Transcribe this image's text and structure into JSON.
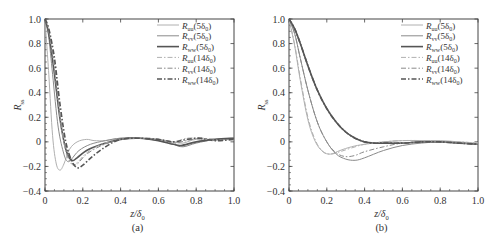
{
  "chart_data": [
    {
      "panel": "(a)",
      "type": "line",
      "title": "",
      "xlabel": "z/δ0",
      "ylabel": "R_ss",
      "xlim": [
        0,
        1.0
      ],
      "ylim": [
        -0.4,
        1.0
      ],
      "xticks": [
        "0",
        "0.2",
        "0.4",
        "0.6",
        "0.8",
        "1.0"
      ],
      "yticks": [
        "-0.4",
        "-0.2",
        "0",
        "0.2",
        "0.4",
        "0.6",
        "0.8",
        "1.0"
      ],
      "grid": false,
      "legend_position": "upper right",
      "series": [
        {
          "name": "Ruu(5δ0)",
          "style": "solid",
          "color": "#b0b0b0",
          "width": 1.0,
          "x": [
            0,
            0.02,
            0.04,
            0.06,
            0.08,
            0.1,
            0.13,
            0.17,
            0.22,
            0.26,
            0.32,
            0.4,
            0.5,
            0.6,
            0.68,
            0.73,
            0.8,
            0.9,
            1.0
          ],
          "y": [
            1.0,
            0.55,
            0.05,
            -0.18,
            -0.23,
            -0.18,
            -0.06,
            0.0,
            0.02,
            0.01,
            0.01,
            0.03,
            0.03,
            0.02,
            0.0,
            -0.01,
            0.02,
            0.01,
            0.03
          ]
        },
        {
          "name": "Rvv(5δ0)",
          "style": "solid",
          "color": "#8a8a8a",
          "width": 1.0,
          "x": [
            0,
            0.02,
            0.04,
            0.07,
            0.1,
            0.12,
            0.14,
            0.18,
            0.24,
            0.32,
            0.4,
            0.5,
            0.6,
            0.68,
            0.73,
            0.8,
            0.9,
            1.0
          ],
          "y": [
            1.0,
            0.85,
            0.55,
            0.12,
            -0.1,
            -0.16,
            -0.14,
            -0.07,
            -0.02,
            0.01,
            0.03,
            0.03,
            0.01,
            -0.02,
            -0.04,
            -0.01,
            0.02,
            0.03
          ]
        },
        {
          "name": "Rww(5δ0)",
          "style": "solid",
          "color": "#555555",
          "width": 1.6,
          "x": [
            0,
            0.02,
            0.05,
            0.08,
            0.11,
            0.14,
            0.17,
            0.22,
            0.3,
            0.4,
            0.5,
            0.6,
            0.68,
            0.72,
            0.8,
            0.9,
            1.0
          ],
          "y": [
            1.0,
            0.88,
            0.55,
            0.18,
            -0.06,
            -0.15,
            -0.13,
            -0.07,
            -0.02,
            0.02,
            0.03,
            0.01,
            -0.02,
            -0.03,
            0.0,
            0.02,
            0.03
          ]
        },
        {
          "name": "Ruu(14δ0)",
          "style": "dashdot",
          "color": "#b0b0b0",
          "width": 1.0,
          "x": [
            0,
            0.02,
            0.05,
            0.08,
            0.11,
            0.14,
            0.17,
            0.22,
            0.3,
            0.4,
            0.5,
            0.6,
            0.68,
            0.75,
            0.82,
            0.9,
            1.0
          ],
          "y": [
            1.0,
            0.9,
            0.6,
            0.2,
            -0.08,
            -0.18,
            -0.17,
            -0.09,
            -0.02,
            0.02,
            0.03,
            0.02,
            0.0,
            0.03,
            0.03,
            0.01,
            0.02
          ]
        },
        {
          "name": "Rvv(14δ0)",
          "style": "dashdot",
          "color": "#8a8a8a",
          "width": 1.0,
          "x": [
            0,
            0.02,
            0.05,
            0.08,
            0.11,
            0.14,
            0.17,
            0.22,
            0.3,
            0.4,
            0.5,
            0.6,
            0.68,
            0.75,
            0.82,
            0.9,
            1.0
          ],
          "y": [
            1.0,
            0.9,
            0.62,
            0.22,
            -0.06,
            -0.17,
            -0.18,
            -0.1,
            -0.03,
            0.02,
            0.03,
            0.02,
            -0.01,
            0.01,
            0.03,
            0.02,
            0.02
          ]
        },
        {
          "name": "Rww(14δ0)",
          "style": "dashdot",
          "color": "#555555",
          "width": 1.6,
          "x": [
            0,
            0.02,
            0.05,
            0.08,
            0.11,
            0.14,
            0.17,
            0.2,
            0.25,
            0.32,
            0.4,
            0.5,
            0.6,
            0.68,
            0.75,
            0.82,
            0.9,
            1.0
          ],
          "y": [
            1.0,
            0.92,
            0.68,
            0.3,
            0.0,
            -0.15,
            -0.21,
            -0.19,
            -0.12,
            -0.04,
            0.02,
            0.03,
            0.02,
            0.0,
            0.02,
            0.03,
            0.01,
            0.02
          ]
        }
      ]
    },
    {
      "panel": "(b)",
      "type": "line",
      "title": "",
      "xlabel": "z/δ0",
      "ylabel": "R_ss",
      "xlim": [
        0,
        1.0
      ],
      "ylim": [
        -0.4,
        1.0
      ],
      "xticks": [
        "0",
        "0.2",
        "0.4",
        "0.6",
        "0.8",
        "1.0"
      ],
      "yticks": [
        "-0.4",
        "-0.2",
        "0",
        "0.2",
        "0.4",
        "0.6",
        "0.8",
        "1.0"
      ],
      "grid": false,
      "legend_position": "upper right",
      "series": [
        {
          "name": "Ruu(5δ0)",
          "style": "solid",
          "color": "#b0b0b0",
          "width": 1.0,
          "x": [
            0,
            0.03,
            0.06,
            0.1,
            0.14,
            0.18,
            0.22,
            0.27,
            0.33,
            0.4,
            0.5,
            0.6,
            0.7,
            0.8,
            0.9,
            1.0
          ],
          "y": [
            1.0,
            0.78,
            0.5,
            0.18,
            0.0,
            -0.08,
            -0.1,
            -0.07,
            -0.04,
            -0.02,
            0.0,
            0.01,
            0.01,
            0.01,
            0.0,
            -0.01
          ]
        },
        {
          "name": "Rvv(5δ0)",
          "style": "solid",
          "color": "#8a8a8a",
          "width": 1.0,
          "x": [
            0,
            0.03,
            0.06,
            0.1,
            0.15,
            0.2,
            0.25,
            0.3,
            0.35,
            0.4,
            0.5,
            0.6,
            0.7,
            0.8,
            0.9,
            1.0
          ],
          "y": [
            1.0,
            0.88,
            0.68,
            0.42,
            0.16,
            0.0,
            -0.1,
            -0.14,
            -0.15,
            -0.13,
            -0.07,
            -0.03,
            -0.01,
            0.0,
            -0.01,
            -0.02
          ]
        },
        {
          "name": "Rww(5δ0)",
          "style": "solid",
          "color": "#555555",
          "width": 1.6,
          "x": [
            0,
            0.03,
            0.06,
            0.1,
            0.15,
            0.2,
            0.25,
            0.3,
            0.35,
            0.4,
            0.45,
            0.5,
            0.6,
            0.7,
            0.8,
            0.9,
            1.0
          ],
          "y": [
            1.0,
            0.92,
            0.8,
            0.62,
            0.42,
            0.27,
            0.16,
            0.08,
            0.03,
            0.0,
            -0.01,
            -0.01,
            -0.01,
            0.0,
            0.0,
            -0.01,
            -0.02
          ]
        },
        {
          "name": "Ruu(14δ0)",
          "style": "dashdot",
          "color": "#b0b0b0",
          "width": 1.0,
          "x": [
            0,
            0.03,
            0.06,
            0.1,
            0.14,
            0.18,
            0.22,
            0.27,
            0.33,
            0.4,
            0.5,
            0.6,
            0.7,
            0.8,
            0.9,
            1.0
          ],
          "y": [
            1.0,
            0.79,
            0.52,
            0.2,
            0.01,
            -0.08,
            -0.1,
            -0.08,
            -0.05,
            -0.02,
            0.0,
            0.01,
            0.01,
            0.0,
            0.0,
            -0.01
          ]
        },
        {
          "name": "Rvv(14δ0)",
          "style": "dashdot",
          "color": "#8a8a8a",
          "width": 1.0,
          "x": [
            0,
            0.03,
            0.06,
            0.1,
            0.15,
            0.2,
            0.25,
            0.3,
            0.35,
            0.4,
            0.5,
            0.6,
            0.7,
            0.8,
            0.9,
            1.0
          ],
          "y": [
            1.0,
            0.88,
            0.68,
            0.42,
            0.16,
            0.0,
            -0.09,
            -0.12,
            -0.11,
            -0.08,
            -0.04,
            -0.01,
            0.0,
            0.0,
            -0.01,
            -0.02
          ]
        },
        {
          "name": "Rww(14δ0)",
          "style": "dashdot",
          "color": "#555555",
          "width": 1.6,
          "x": [
            0,
            0.03,
            0.06,
            0.1,
            0.15,
            0.2,
            0.25,
            0.3,
            0.35,
            0.4,
            0.45,
            0.5,
            0.6,
            0.7,
            0.8,
            0.9,
            1.0
          ],
          "y": [
            1.0,
            0.92,
            0.8,
            0.62,
            0.42,
            0.27,
            0.16,
            0.08,
            0.03,
            0.0,
            -0.01,
            -0.01,
            -0.01,
            0.0,
            0.0,
            -0.01,
            -0.02
          ]
        }
      ]
    }
  ],
  "panels": [
    {
      "caption": "(a)",
      "xlabel_main": "z/δ",
      "xlabel_sub": "0",
      "ylabel_main": "R",
      "ylabel_sub": "ss"
    },
    {
      "caption": "(b)",
      "xlabel_main": "z/δ",
      "xlabel_sub": "0",
      "ylabel_main": "R",
      "ylabel_sub": "ss"
    }
  ],
  "legend": [
    {
      "sym": "R",
      "sub": "uu",
      "arg": "(5δ",
      "argsub": "0",
      "close": ")"
    },
    {
      "sym": "R",
      "sub": "vv",
      "arg": "(5δ",
      "argsub": "0",
      "close": ")"
    },
    {
      "sym": "R",
      "sub": "ww",
      "arg": "(5δ",
      "argsub": "0",
      "close": ")"
    },
    {
      "sym": "R",
      "sub": "uu",
      "arg": "(14δ",
      "argsub": "0",
      "close": ")"
    },
    {
      "sym": "R",
      "sub": "vv",
      "arg": "(14δ",
      "argsub": "0",
      "close": ")"
    },
    {
      "sym": "R",
      "sub": "ww",
      "arg": "(14δ",
      "argsub": "0",
      "close": ")"
    }
  ]
}
